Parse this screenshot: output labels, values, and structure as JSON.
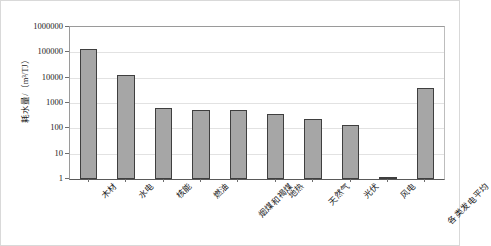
{
  "chart_data": {
    "type": "bar",
    "title": "",
    "xlabel": "",
    "ylabel": "耗水量/（m³/TJ）",
    "yscale": "log",
    "ylim": [
      1,
      1000000
    ],
    "grid": true,
    "legend": false,
    "ytick_labels": [
      "1000000",
      "100000",
      "10000",
      "1000",
      "100",
      "10",
      "1"
    ],
    "ytick_values": [
      1000000,
      100000,
      10000,
      1000,
      100,
      10,
      1
    ],
    "categories": [
      "木材",
      "水电",
      "核能",
      "燃油",
      "烟煤和褐煤",
      "地热",
      "天然气",
      "光伏",
      "风电",
      "各类发电平均"
    ],
    "values": [
      140000,
      13000,
      650,
      520,
      510,
      380,
      240,
      135,
      1.2,
      4000
    ],
    "series": [
      {
        "name": "耗水量",
        "values": [
          140000,
          13000,
          650,
          520,
          510,
          380,
          240,
          135,
          1.2,
          4000
        ]
      }
    ],
    "colors": {
      "bar_fill": "#a6a6a6",
      "bar_border": "#3f3f3f",
      "gridline": "#e2e2e2",
      "axis": "#595959",
      "frame": "#d9d9d9",
      "text": "#1a1a1a"
    }
  }
}
